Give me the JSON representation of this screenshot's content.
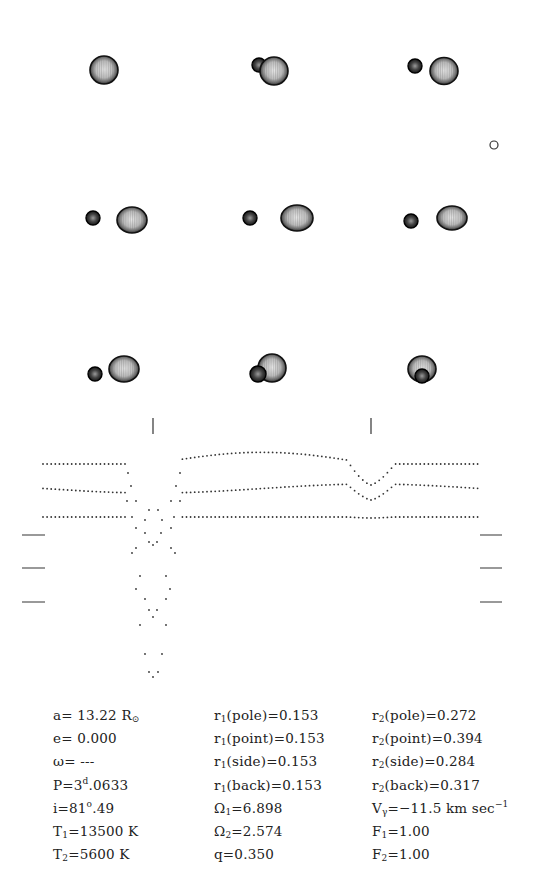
{
  "figure": {
    "type": "binary-star-model",
    "orbit_views": [
      {
        "row": 0,
        "col": 0,
        "primary": {
          "x": 104,
          "y": 70,
          "rx": 14,
          "ry": 14
        },
        "secondary": null
      },
      {
        "row": 0,
        "col": 1,
        "secondary_behind": {
          "x": 259,
          "y": 65,
          "r": 7
        },
        "primary": {
          "x": 274,
          "y": 71,
          "rx": 14,
          "ry": 14
        }
      },
      {
        "row": 0,
        "col": 2,
        "secondary_behind": {
          "x": 415,
          "y": 66,
          "r": 7
        },
        "primary": {
          "x": 444,
          "y": 71,
          "rx": 14,
          "ry": 13.5
        }
      },
      {
        "row": 1,
        "col": 0,
        "secondary": {
          "x": 93,
          "y": 218,
          "r": 7
        },
        "primary": {
          "x": 132,
          "y": 220,
          "rx": 15,
          "ry": 13
        }
      },
      {
        "row": 1,
        "col": 1,
        "secondary": {
          "x": 250,
          "y": 218,
          "r": 7
        },
        "primary": {
          "x": 297,
          "y": 218,
          "rx": 16,
          "ry": 13
        }
      },
      {
        "row": 1,
        "col": 2,
        "secondary": {
          "x": 411,
          "y": 221,
          "r": 7
        },
        "primary": {
          "x": 452,
          "y": 218,
          "rx": 15,
          "ry": 12
        }
      },
      {
        "row": 2,
        "col": 0,
        "secondary": {
          "x": 95,
          "y": 374,
          "r": 7
        },
        "primary": {
          "x": 124,
          "y": 369,
          "rx": 15,
          "ry": 13
        }
      },
      {
        "row": 2,
        "col": 1,
        "secondary_front": {
          "x": 258,
          "y": 374,
          "r": 8
        },
        "primary": {
          "x": 272,
          "y": 368,
          "rx": 14,
          "ry": 14
        }
      },
      {
        "row": 2,
        "col": 2,
        "secondary_front": {
          "x": 422,
          "y": 376,
          "r": 7
        },
        "primary": {
          "x": 422,
          "y": 369,
          "rx": 14,
          "ry": 13
        }
      }
    ],
    "scale_circle": {
      "x": 494,
      "y": 145,
      "r": 4
    },
    "phase_markers": [
      {
        "x": 153,
        "y1": 418,
        "y2": 434
      },
      {
        "x": 371,
        "y1": 418,
        "y2": 434
      }
    ]
  },
  "chart_data": {
    "type": "scatter",
    "title": "",
    "xlabel": "",
    "ylabel": "",
    "x_range_px": [
      43,
      478
    ],
    "primary_eclipse_x_px": 153,
    "secondary_eclipse_x_px": 371,
    "series": [
      {
        "name": "curve-1 (top)",
        "baseline_y_px": 451,
        "max_y_px": 452,
        "secondary_min_y_px": 485,
        "primary_min_y_px": 672
      },
      {
        "name": "curve-2 (middle)",
        "baseline_y_px": 484,
        "max_y_px": 484,
        "secondary_min_y_px": 500,
        "primary_min_y_px": 680
      },
      {
        "name": "curve-3 (bottom)",
        "baseline_y_px": 517,
        "max_y_px": 517,
        "secondary_min_y_px": 518,
        "primary_min_y_px": 680
      }
    ],
    "reference_ticks_left": [
      {
        "x1": 22,
        "x2": 45,
        "y": 535
      },
      {
        "x1": 22,
        "x2": 45,
        "y": 568
      },
      {
        "x1": 22,
        "x2": 45,
        "y": 602
      }
    ],
    "reference_ticks_right": [
      {
        "x1": 480,
        "x2": 502,
        "y": 535
      },
      {
        "x1": 480,
        "x2": 502,
        "y": 568
      },
      {
        "x1": 480,
        "x2": 502,
        "y": 602
      }
    ]
  },
  "params": {
    "col1": [
      {
        "sym": "a",
        "sub": "",
        "sup": "",
        "rest": "=  13.22  R",
        "unit_sub": "⊙"
      },
      {
        "sym": "e",
        "sub": "",
        "sup": "",
        "rest": "=  0.000",
        "unit_sub": ""
      },
      {
        "sym": "ω",
        "sub": "",
        "sup": "",
        "rest": "=  ---",
        "unit_sub": ""
      },
      {
        "sym": "P=3",
        "sub": "",
        "sup": "d",
        "rest": ".0633",
        "unit_sub": ""
      },
      {
        "sym": "i=81",
        "sub": "",
        "sup": "o",
        "rest": ".49",
        "unit_sub": ""
      },
      {
        "sym": "T",
        "sub": "1",
        "sup": "",
        "rest": "=13500  K",
        "unit_sub": ""
      },
      {
        "sym": "T",
        "sub": "2",
        "sup": "",
        "rest": "=5600  K",
        "unit_sub": ""
      }
    ],
    "col2": [
      {
        "sym": "r",
        "sub": "1",
        "sup": "",
        "rest": "(pole)=0.153"
      },
      {
        "sym": "r",
        "sub": "1",
        "sup": "",
        "rest": "(point)=0.153"
      },
      {
        "sym": "r",
        "sub": "1",
        "sup": "",
        "rest": "(side)=0.153"
      },
      {
        "sym": "r",
        "sub": "1",
        "sup": "",
        "rest": "(back)=0.153"
      },
      {
        "sym": "Ω",
        "sub": "1",
        "sup": "",
        "rest": "=6.898"
      },
      {
        "sym": "Ω",
        "sub": "2",
        "sup": "",
        "rest": "=2.574"
      },
      {
        "sym": "q",
        "sub": "",
        "sup": "",
        "rest": "=0.350"
      }
    ],
    "col3": [
      {
        "sym": "r",
        "sub": "2",
        "sup": "",
        "rest": "(pole)=0.272",
        "tail_sup": ""
      },
      {
        "sym": "r",
        "sub": "2",
        "sup": "",
        "rest": "(point)=0.394",
        "tail_sup": ""
      },
      {
        "sym": "r",
        "sub": "2",
        "sup": "",
        "rest": "(side)=0.284",
        "tail_sup": ""
      },
      {
        "sym": "r",
        "sub": "2",
        "sup": "",
        "rest": "(back)=0.317",
        "tail_sup": ""
      },
      {
        "sym": "V",
        "sub": "γ",
        "sup": "",
        "rest": "=−11.5  km  sec",
        "tail_sup": "−1"
      },
      {
        "sym": "F",
        "sub": "1",
        "sup": "",
        "rest": "=1.00",
        "tail_sup": ""
      },
      {
        "sym": "F",
        "sub": "2",
        "sup": "",
        "rest": "=1.00",
        "tail_sup": ""
      }
    ]
  }
}
